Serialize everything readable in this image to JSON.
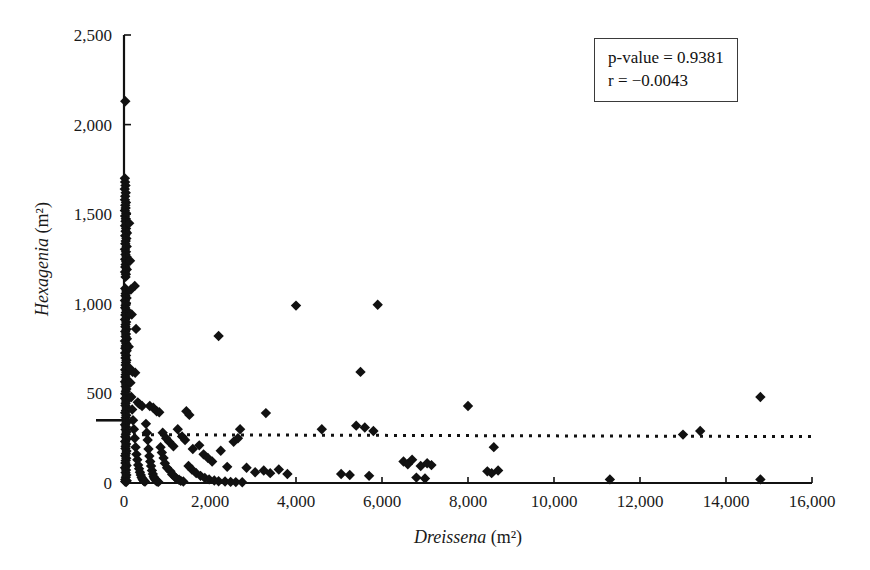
{
  "figure": {
    "background": "#ffffff",
    "foreground": "#111111",
    "marker_color": "#111111",
    "marker_shape": "diamond"
  },
  "annotation": {
    "name": "statistics-box",
    "p_value_line": "p-value = 0.9381",
    "r_line": "r = −0.0043",
    "p_value": 0.9381,
    "r": -0.0043
  },
  "chart_data": {
    "type": "scatter",
    "title": "",
    "xlabel_genus": "Dreissena",
    "xlabel_units": "(m²)",
    "ylabel_genus": "Hexagenia",
    "ylabel_units": "(m²)",
    "xlim": [
      0,
      16000
    ],
    "ylim": [
      0,
      2500
    ],
    "grid": false,
    "legend": "none",
    "xticks": [
      0,
      2000,
      4000,
      6000,
      8000,
      10000,
      12000,
      14000,
      16000
    ],
    "xtick_labels": [
      "0",
      "2,000",
      "4,000",
      "6,000",
      "8,000",
      "10,000",
      "12,000",
      "14,000",
      "16,000"
    ],
    "yticks": [
      0,
      500,
      1000,
      1500,
      2000,
      2500
    ],
    "ytick_labels": [
      "0",
      "500",
      "1,000",
      "1,500",
      "2,000",
      "2,500"
    ],
    "trendline": {
      "style": "dotted",
      "y_value": 270,
      "x_start": 0,
      "x_end": 16000,
      "slope": -0.0002,
      "note": "near-horizontal regression line"
    },
    "points": [
      [
        30,
        2130
      ],
      [
        20,
        1700
      ],
      [
        25,
        1680
      ],
      [
        35,
        1660
      ],
      [
        18,
        1640
      ],
      [
        40,
        1620
      ],
      [
        28,
        1600
      ],
      [
        22,
        1580
      ],
      [
        45,
        1565
      ],
      [
        30,
        1550
      ],
      [
        38,
        1535
      ],
      [
        20,
        1520
      ],
      [
        50,
        1505
      ],
      [
        26,
        1490
      ],
      [
        42,
        1475
      ],
      [
        33,
        1460
      ],
      [
        60,
        1448
      ],
      [
        24,
        1435
      ],
      [
        48,
        1420
      ],
      [
        36,
        1405
      ],
      [
        70,
        1395
      ],
      [
        28,
        1380
      ],
      [
        55,
        1365
      ],
      [
        40,
        1350
      ],
      [
        30,
        1335
      ],
      [
        62,
        1320
      ],
      [
        22,
        1305
      ],
      [
        46,
        1290
      ],
      [
        34,
        1275
      ],
      [
        58,
        1262
      ],
      [
        26,
        1248
      ],
      [
        50,
        1235
      ],
      [
        38,
        1220
      ],
      [
        30,
        1205
      ],
      [
        66,
        1192
      ],
      [
        24,
        1178
      ],
      [
        44,
        1165
      ],
      [
        36,
        1150
      ],
      [
        250,
        1100
      ],
      [
        28,
        1085
      ],
      [
        54,
        1072
      ],
      [
        40,
        1058
      ],
      [
        32,
        1045
      ],
      [
        60,
        1032
      ],
      [
        22,
        1018
      ],
      [
        48,
        1005
      ],
      [
        35,
        992
      ],
      [
        26,
        978
      ],
      [
        56,
        965
      ],
      [
        42,
        952
      ],
      [
        30,
        938
      ],
      [
        64,
        925
      ],
      [
        24,
        912
      ],
      [
        50,
        898
      ],
      [
        38,
        885
      ],
      [
        280,
        860
      ],
      [
        32,
        872
      ],
      [
        58,
        858
      ],
      [
        28,
        845
      ],
      [
        46,
        832
      ],
      [
        36,
        818
      ],
      [
        68,
        805
      ],
      [
        22,
        792
      ],
      [
        52,
        778
      ],
      [
        40,
        765
      ],
      [
        30,
        752
      ],
      [
        62,
        738
      ],
      [
        26,
        725
      ],
      [
        2200,
        820
      ],
      [
        48,
        712
      ],
      [
        34,
        698
      ],
      [
        56,
        685
      ],
      [
        44,
        672
      ],
      [
        38,
        658
      ],
      [
        70,
        645
      ],
      [
        200,
        620
      ],
      [
        260,
        615
      ],
      [
        28,
        632
      ],
      [
        52,
        618
      ],
      [
        40,
        605
      ],
      [
        32,
        592
      ],
      [
        60,
        578
      ],
      [
        24,
        565
      ],
      [
        46,
        552
      ],
      [
        36,
        538
      ],
      [
        5500,
        620
      ],
      [
        4000,
        990
      ],
      [
        5900,
        995
      ],
      [
        55,
        525
      ],
      [
        42,
        512
      ],
      [
        30,
        498
      ],
      [
        64,
        485
      ],
      [
        26,
        472
      ],
      [
        50,
        458
      ],
      [
        14800,
        480
      ],
      [
        38,
        445
      ],
      [
        320,
        450
      ],
      [
        360,
        440
      ],
      [
        420,
        430
      ],
      [
        34,
        432
      ],
      [
        58,
        418
      ],
      [
        44,
        405
      ],
      [
        8000,
        430
      ],
      [
        28,
        392
      ],
      [
        52,
        378
      ],
      [
        40,
        365
      ],
      [
        600,
        430
      ],
      [
        680,
        420
      ],
      [
        760,
        400
      ],
      [
        820,
        395
      ],
      [
        1450,
        400
      ],
      [
        1520,
        380
      ],
      [
        32,
        352
      ],
      [
        60,
        338
      ],
      [
        24,
        325
      ],
      [
        48,
        312
      ],
      [
        36,
        298
      ],
      [
        3300,
        390
      ],
      [
        2700,
        300
      ],
      [
        1250,
        300
      ],
      [
        56,
        285
      ],
      [
        42,
        272
      ],
      [
        30,
        258
      ],
      [
        64,
        245
      ],
      [
        26,
        232
      ],
      [
        50,
        218
      ],
      [
        4600,
        300
      ],
      [
        5400,
        320
      ],
      [
        5600,
        310
      ],
      [
        5800,
        290
      ],
      [
        38,
        205
      ],
      [
        34,
        192
      ],
      [
        58,
        178
      ],
      [
        44,
        165
      ],
      [
        28,
        152
      ],
      [
        52,
        138
      ],
      [
        13000,
        270
      ],
      [
        13400,
        290
      ],
      [
        40,
        125
      ],
      [
        32,
        112
      ],
      [
        60,
        98
      ],
      [
        24,
        85
      ],
      [
        48,
        72
      ],
      [
        36,
        58
      ],
      [
        8600,
        200
      ],
      [
        55,
        45
      ],
      [
        42,
        32
      ],
      [
        30,
        20
      ],
      [
        64,
        12
      ],
      [
        26,
        8
      ],
      [
        50,
        5
      ],
      [
        900,
        280
      ],
      [
        980,
        250
      ],
      [
        1050,
        230
      ],
      [
        1150,
        205
      ],
      [
        1350,
        260
      ],
      [
        1420,
        240
      ],
      [
        1600,
        190
      ],
      [
        1750,
        210
      ],
      [
        1850,
        160
      ],
      [
        1950,
        140
      ],
      [
        2050,
        120
      ],
      [
        2250,
        180
      ],
      [
        2400,
        90
      ],
      [
        2550,
        230
      ],
      [
        2650,
        250
      ],
      [
        2850,
        85
      ],
      [
        3050,
        60
      ],
      [
        3250,
        70
      ],
      [
        3400,
        55
      ],
      [
        3600,
        75
      ],
      [
        3800,
        50
      ],
      [
        5050,
        50
      ],
      [
        5250,
        45
      ],
      [
        5700,
        40
      ],
      [
        6500,
        120
      ],
      [
        6600,
        105
      ],
      [
        6700,
        130
      ],
      [
        6900,
        95
      ],
      [
        7050,
        110
      ],
      [
        7150,
        100
      ],
      [
        8450,
        65
      ],
      [
        8550,
        55
      ],
      [
        8700,
        70
      ],
      [
        6800,
        30
      ],
      [
        7000,
        25
      ],
      [
        11300,
        20
      ],
      [
        14800,
        20
      ],
      [
        120,
        1450
      ],
      [
        140,
        1240
      ],
      [
        160,
        1080
      ],
      [
        180,
        940
      ],
      [
        110,
        760
      ],
      [
        130,
        640
      ],
      [
        150,
        560
      ],
      [
        170,
        480
      ],
      [
        190,
        410
      ],
      [
        210,
        350
      ],
      [
        230,
        300
      ],
      [
        250,
        250
      ],
      [
        270,
        200
      ],
      [
        290,
        160
      ],
      [
        310,
        130
      ],
      [
        330,
        100
      ],
      [
        350,
        80
      ],
      [
        370,
        60
      ],
      [
        390,
        45
      ],
      [
        410,
        30
      ],
      [
        430,
        22
      ],
      [
        450,
        15
      ],
      [
        470,
        10
      ],
      [
        490,
        8
      ],
      [
        510,
        330
      ],
      [
        530,
        280
      ],
      [
        550,
        240
      ],
      [
        570,
        190
      ],
      [
        590,
        150
      ],
      [
        610,
        120
      ],
      [
        630,
        95
      ],
      [
        650,
        70
      ],
      [
        670,
        50
      ],
      [
        690,
        35
      ],
      [
        710,
        25
      ],
      [
        730,
        18
      ],
      [
        750,
        12
      ],
      [
        770,
        8
      ],
      [
        800,
        6
      ],
      [
        850,
        200
      ],
      [
        880,
        170
      ],
      [
        920,
        140
      ],
      [
        950,
        110
      ],
      [
        1000,
        85
      ],
      [
        1080,
        65
      ],
      [
        1120,
        48
      ],
      [
        1180,
        35
      ],
      [
        1220,
        25
      ],
      [
        1280,
        18
      ],
      [
        1320,
        12
      ],
      [
        1380,
        8
      ],
      [
        1500,
        95
      ],
      [
        1580,
        75
      ],
      [
        1680,
        55
      ],
      [
        1780,
        40
      ],
      [
        1880,
        28
      ],
      [
        1980,
        20
      ],
      [
        2100,
        14
      ],
      [
        2200,
        10
      ],
      [
        2350,
        8
      ],
      [
        2480,
        6
      ],
      [
        2600,
        5
      ],
      [
        2750,
        4
      ]
    ]
  }
}
